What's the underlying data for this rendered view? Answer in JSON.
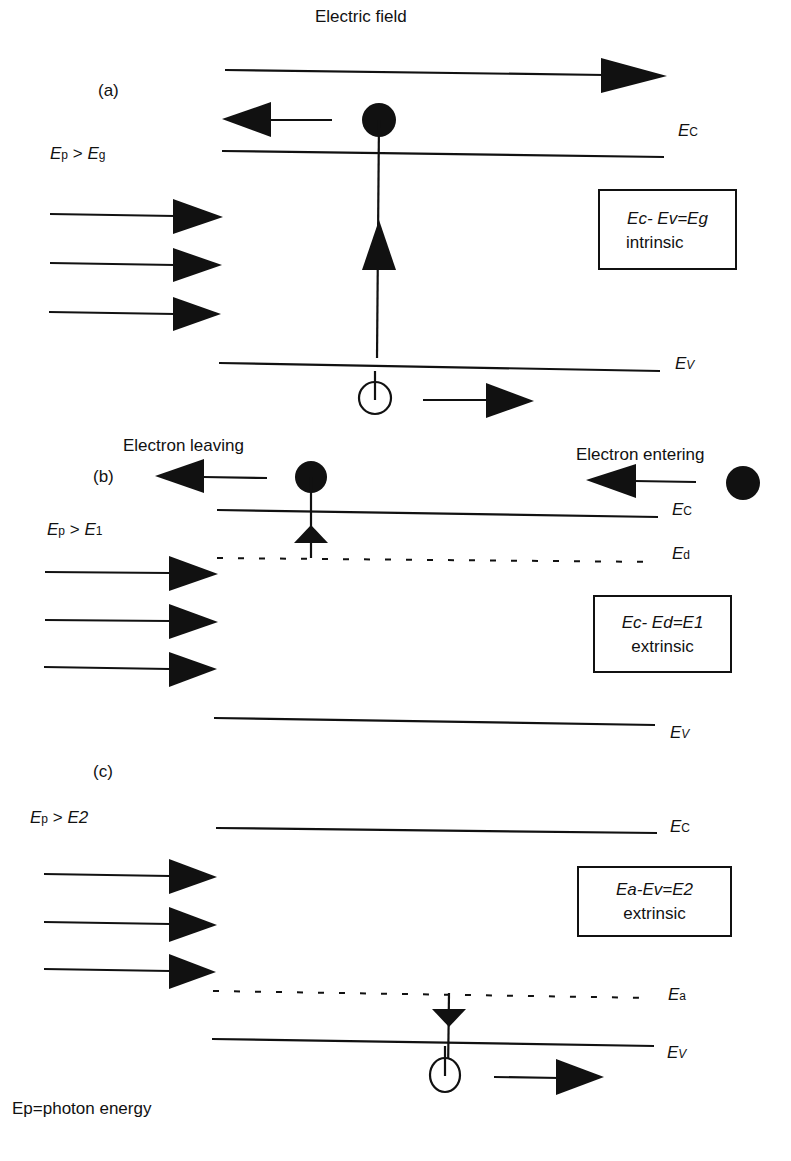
{
  "figure": {
    "footer_note": "Ep=photon energy",
    "caption_truncated": ""
  },
  "panel_a": {
    "label": "(a)",
    "condition": {
      "lhs": "E",
      "lhs_sub": "p",
      "op": " > ",
      "rhs": "E",
      "rhs_sub": "g"
    },
    "field_label": "Electric field",
    "level_top": {
      "main": "E",
      "sub": "C"
    },
    "level_bottom": {
      "main": "E",
      "sub": "V"
    },
    "box": {
      "line1": "Ec- Ev=Eg",
      "line2": "intrinsic"
    }
  },
  "panel_b": {
    "label": "(b)",
    "condition": {
      "lhs": "E",
      "lhs_sub": "p",
      "op": " > ",
      "rhs": "E",
      "rhs_sub": "1"
    },
    "leaving_label": "Electron leaving",
    "entering_label": "Electron entering",
    "level_top": {
      "main": "E",
      "sub": "C"
    },
    "level_mid": {
      "main": "E",
      "sub": "d"
    },
    "level_bottom": {
      "main": "E",
      "sub": "V"
    },
    "box": {
      "line1": "Ec- Ed=E1",
      "line2": "extrinsic"
    }
  },
  "panel_c": {
    "label": "(c)",
    "condition": {
      "lhs": "E",
      "lhs_sub": "p",
      "op": " > ",
      "rhs": "E2",
      "rhs_sub": ""
    },
    "level_top": {
      "main": "E",
      "sub": "C"
    },
    "level_mid": {
      "main": "E",
      "sub": "a"
    },
    "level_bottom": {
      "main": "E",
      "sub": "V"
    },
    "box": {
      "line1": "Ea-Ev=E2",
      "line2": "extrinsic"
    }
  },
  "colors": {
    "ink": "#111111",
    "background": "#ffffff"
  }
}
